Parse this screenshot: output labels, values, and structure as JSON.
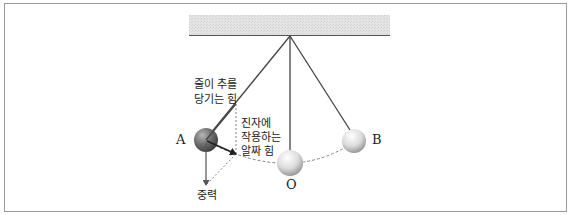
{
  "diagram": {
    "type": "pendulum-forces",
    "labels": {
      "tension_line1": "줄이 추를",
      "tension_line2": "당기는 힘",
      "net_force_line1": "진자에",
      "net_force_line2": "작용하는",
      "net_force_line3": "알짜 힘",
      "gravity": "중력"
    },
    "points": {
      "A": "A",
      "O": "O",
      "B": "B"
    },
    "colors": {
      "frame_border": "#9a9a9a",
      "ceiling_fill": "#e2e2e2",
      "ceiling_edge": "#555555",
      "string": "#444444",
      "ball_A": "#6e6e6e",
      "ball_light": "#d8d8d8",
      "arrow": "#222222",
      "dashed": "#777777"
    }
  }
}
